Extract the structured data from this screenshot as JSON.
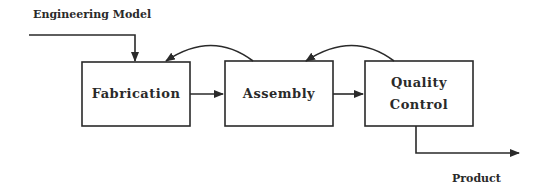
{
  "diagram": {
    "input_label": "Engineering Model",
    "output_label": "Product",
    "stroke_color": "#2a2a2a",
    "nodes": [
      {
        "id": "fabrication",
        "label": "Fabrication"
      },
      {
        "id": "assembly",
        "label": "Assembly"
      },
      {
        "id": "quality-control",
        "label_line1": "Quality",
        "label_line2": "Control"
      }
    ],
    "edges": [
      {
        "from": "engineering-model",
        "to": "fabrication",
        "type": "input"
      },
      {
        "from": "fabrication",
        "to": "assembly",
        "type": "forward"
      },
      {
        "from": "assembly",
        "to": "quality-control",
        "type": "forward"
      },
      {
        "from": "assembly",
        "to": "fabrication",
        "type": "feedback"
      },
      {
        "from": "quality-control",
        "to": "assembly",
        "type": "feedback"
      },
      {
        "from": "quality-control",
        "to": "product",
        "type": "output"
      }
    ]
  }
}
